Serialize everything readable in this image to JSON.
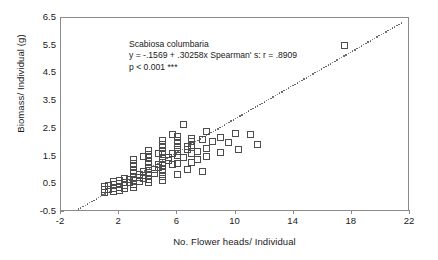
{
  "chart_data": {
    "type": "scatter",
    "title": "",
    "annotation": {
      "species": "Scabiosa columbaria",
      "equation": "y = -.1569 + .30258x Spearman' s: r = .8909",
      "significance": "p < 0.001 ***"
    },
    "xlabel": "No. Flower heads/ Individual",
    "ylabel": "Biomass/ Individual (g)",
    "xlim": [
      -2,
      22
    ],
    "ylim": [
      -0.5,
      6.5
    ],
    "xticks": [
      -2,
      2,
      6,
      10,
      14,
      18,
      22
    ],
    "yticks": [
      -0.5,
      0.5,
      1.5,
      2.5,
      3.5,
      4.5,
      5.5,
      6.5
    ],
    "xtick_labels": [
      "-2",
      "2",
      "6",
      "10",
      "14",
      "18",
      "22"
    ],
    "ytick_labels": [
      "-0.5",
      "0.5",
      "1.5",
      "2.5",
      "3.5",
      "4.5",
      "5.5",
      "6.5"
    ],
    "grid": false,
    "legend": "none",
    "fit_line": {
      "style": "dotted",
      "intercept": -0.1569,
      "slope": 0.30258,
      "x_start": -1.4,
      "x_end": 21.4
    },
    "marker_style": "open-square",
    "points": [
      [
        1.0,
        0.3
      ],
      [
        1.0,
        0.42
      ],
      [
        1.0,
        0.2
      ],
      [
        1.3,
        0.32
      ],
      [
        1.3,
        0.45
      ],
      [
        1.6,
        0.35
      ],
      [
        1.6,
        0.48
      ],
      [
        1.6,
        0.6
      ],
      [
        1.6,
        0.24
      ],
      [
        2.0,
        0.4
      ],
      [
        2.0,
        0.52
      ],
      [
        2.0,
        0.64
      ],
      [
        2.0,
        0.28
      ],
      [
        2.4,
        0.45
      ],
      [
        2.4,
        0.58
      ],
      [
        2.4,
        0.7
      ],
      [
        2.4,
        0.33
      ],
      [
        2.7,
        0.55
      ],
      [
        2.7,
        0.68
      ],
      [
        3.0,
        0.5
      ],
      [
        3.0,
        0.62
      ],
      [
        3.0,
        0.75
      ],
      [
        3.0,
        0.88
      ],
      [
        3.0,
        1.0
      ],
      [
        3.0,
        1.13
      ],
      [
        3.0,
        1.26
      ],
      [
        3.0,
        1.39
      ],
      [
        3.0,
        0.38
      ],
      [
        3.4,
        0.6
      ],
      [
        3.4,
        0.73
      ],
      [
        3.4,
        0.86
      ],
      [
        3.7,
        0.7
      ],
      [
        3.7,
        0.83
      ],
      [
        3.7,
        0.96
      ],
      [
        3.7,
        1.52
      ],
      [
        4.0,
        0.55
      ],
      [
        4.0,
        0.68
      ],
      [
        4.0,
        0.81
      ],
      [
        4.0,
        0.94
      ],
      [
        4.0,
        1.07
      ],
      [
        4.0,
        1.2
      ],
      [
        4.0,
        1.33
      ],
      [
        4.0,
        1.46
      ],
      [
        4.0,
        1.59
      ],
      [
        4.0,
        1.72
      ],
      [
        4.4,
        0.9
      ],
      [
        4.4,
        1.03
      ],
      [
        4.7,
        1.1
      ],
      [
        4.7,
        1.23
      ],
      [
        4.7,
        1.62
      ],
      [
        5.0,
        0.65
      ],
      [
        5.0,
        0.78
      ],
      [
        5.0,
        0.91
      ],
      [
        5.0,
        1.04
      ],
      [
        5.0,
        1.17
      ],
      [
        5.0,
        1.3
      ],
      [
        5.0,
        1.43
      ],
      [
        5.0,
        1.56
      ],
      [
        5.0,
        1.69
      ],
      [
        5.0,
        1.82
      ],
      [
        5.0,
        1.95
      ],
      [
        5.0,
        2.08
      ],
      [
        5.4,
        1.35
      ],
      [
        5.4,
        1.48
      ],
      [
        5.7,
        1.2
      ],
      [
        5.7,
        1.6
      ],
      [
        5.7,
        2.3
      ],
      [
        6.0,
        0.85
      ],
      [
        6.0,
        1.25
      ],
      [
        6.0,
        1.55
      ],
      [
        6.0,
        1.7
      ],
      [
        6.0,
        1.83
      ],
      [
        6.0,
        1.96
      ],
      [
        6.0,
        2.09
      ],
      [
        6.0,
        2.22
      ],
      [
        6.4,
        1.45
      ],
      [
        6.4,
        2.65
      ],
      [
        6.7,
        1.05
      ],
      [
        6.7,
        1.75
      ],
      [
        6.7,
        1.88
      ],
      [
        7.0,
        1.3
      ],
      [
        7.0,
        1.6
      ],
      [
        7.0,
        1.9
      ],
      [
        7.0,
        2.03
      ],
      [
        7.0,
        2.16
      ],
      [
        7.4,
        1.4
      ],
      [
        7.4,
        1.7
      ],
      [
        7.7,
        0.95
      ],
      [
        7.7,
        2.1
      ],
      [
        8.0,
        1.5
      ],
      [
        8.0,
        1.8
      ],
      [
        8.0,
        2.4
      ],
      [
        8.4,
        2.05
      ],
      [
        9.0,
        1.65
      ],
      [
        9.0,
        2.2
      ],
      [
        9.5,
        2.0
      ],
      [
        10.0,
        2.35
      ],
      [
        10.2,
        1.75
      ],
      [
        11.0,
        2.3
      ],
      [
        11.5,
        1.95
      ],
      [
        17.5,
        5.5
      ]
    ]
  }
}
